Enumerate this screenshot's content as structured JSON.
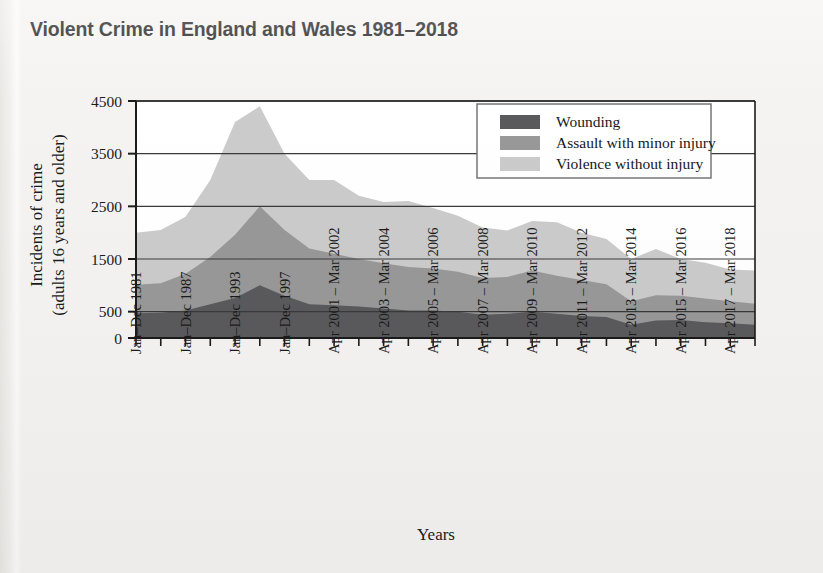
{
  "title": "Violent Crime in England and Wales 1981–2018",
  "axes": {
    "ylabel_line1": "Incidents of crime",
    "ylabel_line2": "(adults 16 years and older)",
    "xlabel": "Years",
    "yticks": [
      "0",
      "500",
      "1500",
      "2500",
      "3500",
      "4500"
    ]
  },
  "legend": {
    "items": [
      {
        "label": "Wounding",
        "color": "#5a5a5c"
      },
      {
        "label": "Assault with minor injury",
        "color": "#989899"
      },
      {
        "label": "Violence without injury",
        "color": "#cbcbcb"
      }
    ]
  },
  "colors": {
    "wounding": "#5a5a5c",
    "assault_minor_injury": "#989899",
    "violence_without_injury": "#cbcbcb",
    "axis": "#1b1b1b",
    "gridline": "#3a3a3a",
    "background": "#f4f3f1",
    "plot_background": "#ffffff"
  },
  "chart_data": {
    "type": "area",
    "stacked": true,
    "title": "Violent Crime in England and Wales 1981–2018",
    "xlabel": "Years",
    "ylabel": "Incidents of crime (adults 16 years and older)",
    "ylim": [
      0,
      4500
    ],
    "yticks": [
      0,
      500,
      1500,
      2500,
      3500,
      4500
    ],
    "grid": "horizontal",
    "legend_position": "top-right inside plot",
    "x_tick_labels": [
      "Jan–Dec 1981",
      "Jan–Dec 1987",
      "Jan–Dec 1993",
      "Jan–Dec 1997",
      "Apr 2001 – Mar 2002",
      "Apr 2003 – Mar 2004",
      "Apr 2005 – Mar 2006",
      "Apr 2007 – Mar 2008",
      "Apr 2009 – Mar 2010",
      "Apr 2011 – Mar 2012",
      "Apr 2013 – Mar 2014",
      "Apr 2015 – Mar 2016",
      "Apr 2017 – Mar 2018"
    ],
    "x_labelled_tick_indices": [
      0,
      2,
      4,
      6,
      8,
      10,
      12,
      14,
      16,
      18,
      20,
      22,
      24
    ],
    "n_ticks": 26,
    "categories": [
      "Jan–Dec 1981",
      "Jan–Dec 1984",
      "Jan–Dec 1987",
      "Jan–Dec 1990",
      "Jan–Dec 1993",
      "Jan–Dec 1995",
      "Jan–Dec 1997",
      "Jan–Dec 1999",
      "Apr 2001 – Mar 2002",
      "Apr 2002 – Mar 2003",
      "Apr 2003 – Mar 2004",
      "Apr 2004 – Mar 2005",
      "Apr 2005 – Mar 2006",
      "Apr 2006 – Mar 2007",
      "Apr 2007 – Mar 2008",
      "Apr 2008 – Mar 2009",
      "Apr 2009 – Mar 2010",
      "Apr 2010 – Mar 2011",
      "Apr 2011 – Mar 2012",
      "Apr 2012 – Mar 2013",
      "Apr 2013 – Mar 2014",
      "Apr 2014 – Mar 2015",
      "Apr 2015 – Mar 2016",
      "Apr 2016 – Mar 2017",
      "Apr 2017 – Mar 2018",
      "Apr 2018 – Mar 2019"
    ],
    "series": [
      {
        "name": "Wounding",
        "color": "#5a5a5c",
        "values": [
          470,
          480,
          520,
          640,
          760,
          1000,
          800,
          640,
          620,
          600,
          560,
          520,
          520,
          500,
          440,
          460,
          500,
          460,
          420,
          400,
          250,
          330,
          340,
          300,
          280,
          250
        ]
      },
      {
        "name": "Assault with minor injury",
        "color": "#989899",
        "values": [
          540,
          560,
          700,
          900,
          1200,
          1500,
          1250,
          1060,
          980,
          900,
          860,
          830,
          800,
          760,
          700,
          700,
          780,
          720,
          680,
          620,
          450,
          480,
          460,
          450,
          420,
          400
        ]
      },
      {
        "name": "Violence without injury",
        "color": "#cbcbcb",
        "values": [
          990,
          1010,
          1080,
          1460,
          2140,
          1900,
          1450,
          1300,
          1400,
          1200,
          1160,
          1250,
          1150,
          1060,
          960,
          880,
          940,
          1020,
          900,
          860,
          800,
          880,
          700,
          680,
          600,
          630
        ]
      }
    ],
    "stack_totals": [
      2000,
      2050,
      2300,
      3000,
      4100,
      4400,
      3500,
      3000,
      3000,
      2700,
      2580,
      2600,
      2470,
      2320,
      2100,
      2040,
      2220,
      2200,
      2000,
      1880,
      1500,
      1690,
      1500,
      1430,
      1300,
      1280
    ]
  },
  "geometry": {
    "plot_left": 136,
    "plot_right": 755,
    "plot_top": 101,
    "plot_bottom": 338
  }
}
